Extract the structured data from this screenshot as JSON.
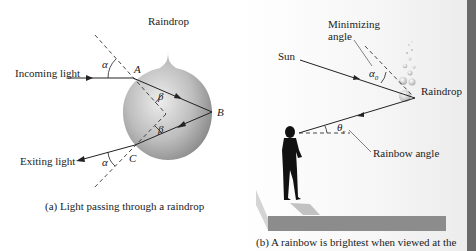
{
  "panel_a": {
    "labels": {
      "raindrop": "Raindrop",
      "incoming_light": "Incoming light",
      "exiting_light": "Exiting light",
      "point_a": "A",
      "point_b": "B",
      "point_c": "C",
      "alpha_top": "α",
      "alpha_bottom": "α",
      "beta_top": "β",
      "beta_bottom": "β"
    },
    "caption": "(a) Light passing through a raindrop"
  },
  "panel_b": {
    "labels": {
      "minimizing_angle_line1": "Minimizing",
      "minimizing_angle_line2": "angle",
      "sun": "Sun",
      "raindrop": "Raindrop",
      "alpha0": "α",
      "alpha0_sub": "0",
      "theta_r": "θ",
      "theta_r_sub": "r",
      "rainbow_angle": "Rainbow angle"
    },
    "caption": "(b) A rainbow is brightest when viewed at the"
  },
  "colors": {
    "ink": "#222222",
    "drop_light": "#e6e6e6",
    "drop_dark": "#8a8a8a",
    "floor": "#8c8c8c",
    "side_bar": "#6a6a6a"
  }
}
